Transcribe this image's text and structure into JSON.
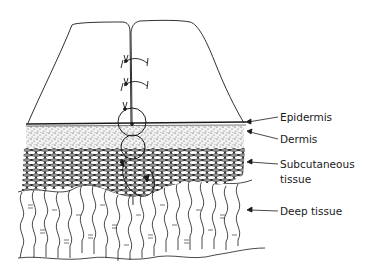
{
  "diagram": {
    "labels": {
      "epidermis": "Epidermis",
      "dermis": "Dermis",
      "subcutaneous_line1": "Subcutaneous",
      "subcutaneous_line2": "tissue",
      "deep_tissue": "Deep tissue"
    },
    "colors": {
      "ink": "#1a1a1a",
      "background": "#ffffff"
    }
  }
}
